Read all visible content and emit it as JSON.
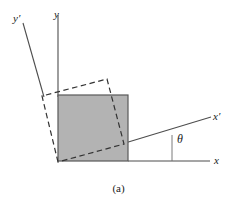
{
  "figure": {
    "caption": "(a)",
    "colors": {
      "line": "#4d4d4d",
      "shape_fill": "#b3b3b3",
      "shape_stroke": "#595959",
      "dashed_stroke": "#333333",
      "text": "#1a1a1a",
      "background": "#ffffff"
    },
    "labels": {
      "y_prime": "y′",
      "y": "y",
      "x_prime": "x′",
      "x": "x",
      "theta": "θ"
    },
    "geometry": {
      "rotation_angle_deg": 14,
      "origin": {
        "x": 58,
        "y": 161
      },
      "axis_y": {
        "x1": 58,
        "y1": 15,
        "x2": 58,
        "y2": 97
      },
      "axis_y_prime": {
        "x1": 23,
        "y1": 23,
        "x2": 44,
        "y2": 97
      },
      "axis_x": {
        "x1": 128,
        "y1": 161,
        "x2": 210,
        "y2": 161
      },
      "axis_x_prime": {
        "x1": 125,
        "y1": 143,
        "x2": 211,
        "y2": 117
      },
      "angle_tick": {
        "x1": 172,
        "y1": 161,
        "x2": 172,
        "y2": 135
      },
      "solid_square": {
        "left": 58,
        "top": 95,
        "width": 70,
        "height": 66
      },
      "dashed_square_points": "58,162 42,96 107,79 124,144"
    }
  }
}
